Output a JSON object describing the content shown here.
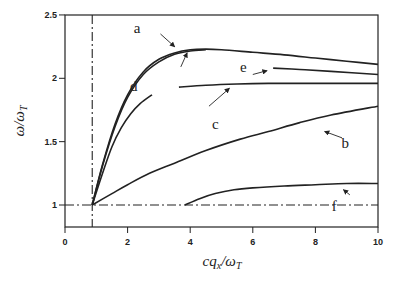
{
  "chart_data": {
    "type": "line",
    "title": "",
    "xlabel": "cq_x/ω_T",
    "ylabel": "ω/ω_T",
    "xlabel_display": {
      "main": "cq",
      "sub1": "x",
      "mid": "/ω",
      "sub2": "T"
    },
    "ylabel_display": {
      "main": "ω/ω",
      "sub": "T"
    },
    "xlim": [
      0,
      10
    ],
    "ylim": [
      0.83,
      2.5
    ],
    "x_ticks": [
      0,
      2,
      4,
      6,
      8,
      10
    ],
    "y_ticks": [
      1,
      1.5,
      2,
      2.5
    ],
    "x_tick_labels": [
      "0",
      "2",
      "4",
      "6",
      "8",
      "10"
    ],
    "y_tick_labels": [
      "1",
      "1.5",
      "2",
      "2.5"
    ],
    "grid": false,
    "legend": "none (curves labeled inline with arrows)",
    "reference_lines": [
      {
        "orientation": "vertical",
        "x": 0.87,
        "style": "dash-dot"
      },
      {
        "orientation": "horizontal",
        "y": 1.0,
        "style": "dash-dot"
      }
    ],
    "series": [
      {
        "name": "a",
        "x": [
          0.87,
          1.2,
          1.6,
          2.0,
          2.5,
          3.0,
          3.5,
          4.0,
          4.5,
          5.0,
          6.0,
          7.0,
          8.0,
          9.0,
          10.0
        ],
        "y": [
          1.0,
          1.32,
          1.64,
          1.87,
          2.05,
          2.15,
          2.2,
          2.225,
          2.23,
          2.225,
          2.205,
          2.185,
          2.16,
          2.135,
          2.11
        ]
      },
      {
        "name": "d_upper",
        "x": [
          0.87,
          1.2,
          1.6,
          2.0,
          2.5,
          3.0,
          3.5,
          4.0,
          4.5
        ],
        "y": [
          1.0,
          1.31,
          1.62,
          1.85,
          2.03,
          2.13,
          2.19,
          2.215,
          2.225
        ]
      },
      {
        "name": "d",
        "x": [
          0.87,
          1.2,
          1.5,
          1.8,
          2.1,
          2.4,
          2.78
        ],
        "y": [
          1.0,
          1.25,
          1.46,
          1.61,
          1.72,
          1.8,
          1.87
        ]
      },
      {
        "name": "c",
        "x": [
          3.64,
          4.5,
          5.5,
          6.5,
          7.5,
          8.5,
          10.0
        ],
        "y": [
          1.93,
          1.945,
          1.955,
          1.96,
          1.96,
          1.96,
          1.96
        ]
      },
      {
        "name": "e",
        "x": [
          6.65,
          7.5,
          8.5,
          10.0
        ],
        "y": [
          2.08,
          2.07,
          2.055,
          2.03
        ]
      },
      {
        "name": "b",
        "x": [
          0.87,
          1.5,
          2.0,
          2.7,
          3.5,
          4.5,
          5.6,
          6.5,
          7.5,
          8.5,
          10.0
        ],
        "y": [
          1.0,
          1.09,
          1.16,
          1.25,
          1.33,
          1.43,
          1.52,
          1.58,
          1.65,
          1.71,
          1.78
        ]
      },
      {
        "name": "f",
        "x": [
          3.83,
          4.3,
          4.8,
          5.4,
          6.0,
          7.0,
          8.0,
          9.0,
          10.0
        ],
        "y": [
          1.0,
          1.05,
          1.09,
          1.12,
          1.135,
          1.15,
          1.16,
          1.17,
          1.17
        ]
      }
    ],
    "annotations": [
      {
        "text": "a",
        "x": 2.3,
        "y": 2.36,
        "arrow_from": [
          3.05,
          2.35
        ],
        "arrow_to": [
          3.5,
          2.25
        ]
      },
      {
        "text": "d",
        "x": 2.2,
        "y": 1.9,
        "arrow_from": [
          3.7,
          2.09
        ],
        "arrow_to": [
          3.9,
          2.2
        ]
      },
      {
        "text": "c",
        "x": 4.8,
        "y": 1.6,
        "arrow_from": [
          4.6,
          1.78
        ],
        "arrow_to": [
          5.25,
          1.92
        ]
      },
      {
        "text": "e",
        "x": 5.7,
        "y": 2.05,
        "arrow_from": [
          6.0,
          2.03
        ],
        "arrow_to": [
          6.45,
          2.06
        ]
      },
      {
        "text": "b",
        "x": 8.95,
        "y": 1.45,
        "arrow_from": [
          8.85,
          1.53
        ],
        "arrow_to": [
          8.3,
          1.58
        ]
      },
      {
        "text": "f",
        "x": 8.6,
        "y": 0.95,
        "arrow_from": [
          9.1,
          1.08
        ],
        "arrow_to": [
          8.9,
          1.12
        ]
      }
    ]
  }
}
